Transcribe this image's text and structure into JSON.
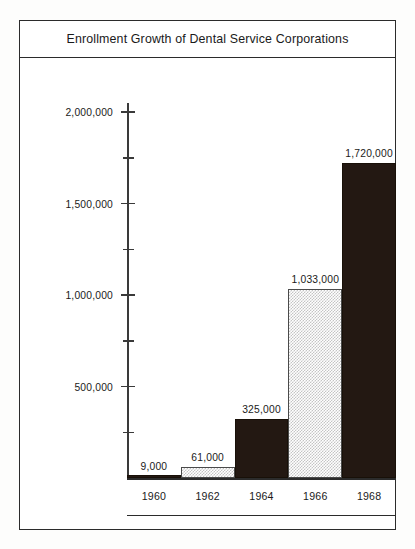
{
  "chart_data": {
    "type": "bar",
    "title": "Enrollment Growth of Dental Service Corporations",
    "xlabel": "",
    "ylabel": "",
    "categories": [
      "1960",
      "1962",
      "1964",
      "1966",
      "1968"
    ],
    "values": [
      9000,
      61000,
      325000,
      1033000,
      1720000
    ],
    "value_labels": [
      "9,000",
      "61,000",
      "325,000",
      "1,033,000",
      "1,720,000"
    ],
    "ylim": [
      0,
      2000000
    ],
    "y_major_ticks": [
      500000,
      1000000,
      1500000,
      2000000
    ],
    "y_major_tick_labels": [
      "500,000",
      "1,000,000",
      "1,500,000",
      "2,000,000"
    ],
    "y_minor_ticks": [
      250000,
      750000,
      1250000,
      1750000
    ],
    "grid": false,
    "legend": null,
    "series": [
      {
        "name": "Enrollment",
        "values": [
          9000,
          61000,
          325000,
          1033000,
          1720000
        ],
        "fills": [
          "dark",
          "light",
          "dark",
          "light",
          "dark"
        ]
      }
    ]
  },
  "colors": {
    "bar_dark": "#231812",
    "bar_light_screen": "#c4c4c4",
    "frame": "#2b2b2b",
    "axis": "#3a3a3a",
    "text": "#1a1a1a",
    "background": "#ffffff"
  }
}
